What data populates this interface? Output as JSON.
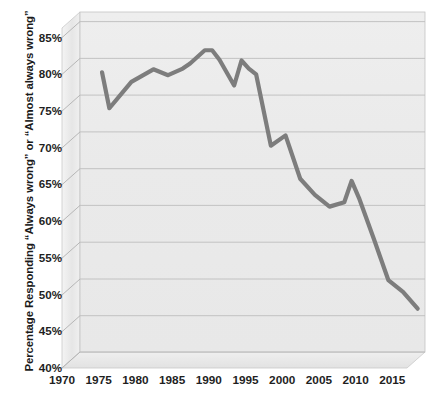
{
  "chart_data": {
    "type": "line",
    "title": "",
    "xlabel": "",
    "ylabel": "Percentage Responding \"Always wrong\" or \"Almost always wrong\"",
    "xlim": [
      1970,
      2017
    ],
    "ylim": [
      40,
      85
    ],
    "grid": true,
    "legend": "none",
    "style": "3d-perspective-wall-and-floor",
    "line_color": "#7d7d7d",
    "plot_background": "#ececec",
    "gridline_color": "#bdbdbd",
    "x_ticks": [
      1970,
      1975,
      1980,
      1985,
      1990,
      1995,
      2000,
      2005,
      2010,
      2015
    ],
    "x_tick_labels": [
      "1970",
      "1975",
      "1980",
      "1985",
      "1990",
      "1995",
      "2000",
      "2005",
      "2010",
      "2015"
    ],
    "y_ticks": [
      40,
      45,
      50,
      55,
      60,
      65,
      70,
      75,
      80,
      85
    ],
    "y_tick_labels": [
      "40%",
      "45%",
      "50%",
      "55%",
      "60%",
      "65%",
      "70%",
      "75%",
      "80%",
      "85%"
    ],
    "series": [
      {
        "name": "Percentage Responding Always wrong or Almost always wrong",
        "x": [
          1973,
          1974,
          1976,
          1977,
          1980,
          1982,
          1984,
          1985,
          1987,
          1988,
          1989,
          1991,
          1992,
          1993,
          1994,
          1996,
          1998,
          2000,
          2002,
          2004,
          2006,
          2007,
          2008,
          2010,
          2012,
          2014,
          2016
        ],
        "values": [
          78.1,
          73.2,
          75.6,
          76.8,
          78.5,
          77.7,
          78.6,
          79.3,
          81.1,
          81.1,
          79.8,
          76.3,
          79.7,
          78.6,
          77.8,
          68.1,
          69.5,
          63.6,
          61.4,
          59.8,
          60.4,
          63.3,
          61.0,
          55.5,
          49.8,
          48.2,
          45.9
        ]
      }
    ]
  },
  "axes": {
    "y_title": "Percentage Responding “Always wrong” or “Almost always wrong”"
  }
}
